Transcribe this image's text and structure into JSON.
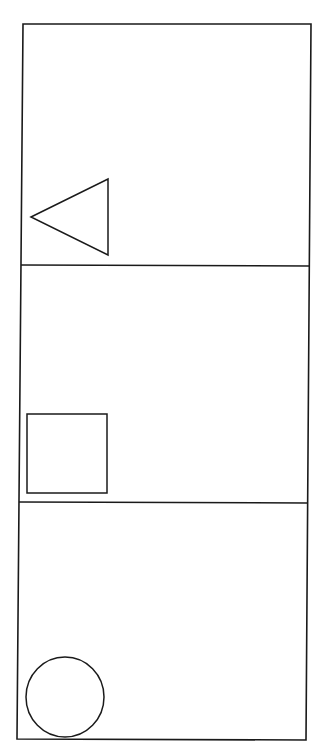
{
  "diagram": {
    "stroke_color": "#1a1a1a",
    "background_color": "#ffffff",
    "panels": [
      {
        "index": 1,
        "shape": "triangle",
        "orientation": "pointing-left"
      },
      {
        "index": 2,
        "shape": "square"
      },
      {
        "index": 3,
        "shape": "circle"
      }
    ]
  }
}
